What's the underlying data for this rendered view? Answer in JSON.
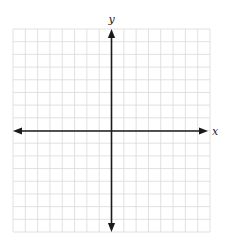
{
  "diagram": {
    "type": "coordinate-plane",
    "grid": {
      "columns": 16,
      "rows": 16,
      "left": 13,
      "top": 29,
      "right": 210,
      "bottom": 232,
      "line_color": "#d9d9d9",
      "line_width": 0.8
    },
    "axes": {
      "origin": {
        "x": 111.5,
        "y": 131
      },
      "color": "#1a1a1a",
      "width": 1.6,
      "x_axis": {
        "label": "x",
        "from": 13,
        "to": 208,
        "arrows": "both"
      },
      "y_axis": {
        "label": "y",
        "from": 29,
        "to": 232,
        "arrows": "both"
      }
    },
    "labels": {
      "x": "x",
      "y": "y"
    }
  }
}
